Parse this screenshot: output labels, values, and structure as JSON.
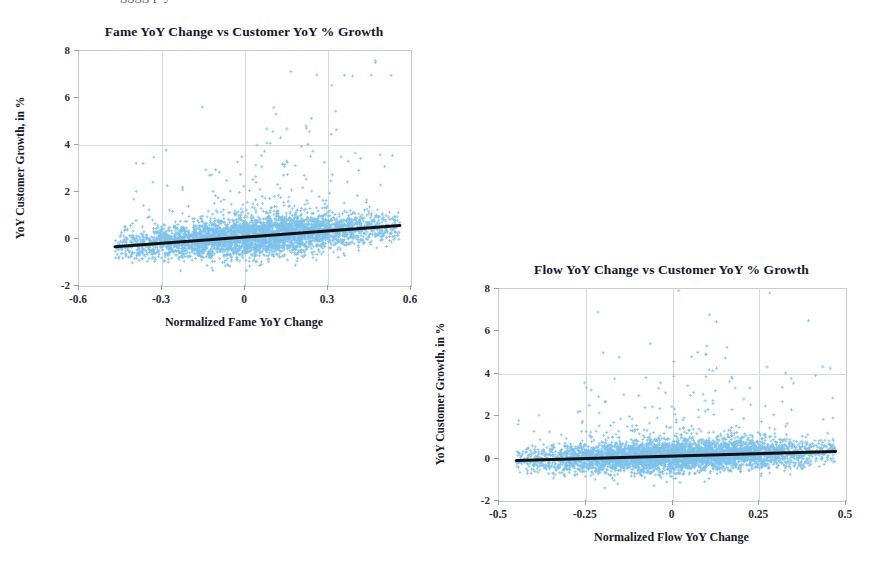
{
  "page": {
    "top_cut_text": "gggg  p  y"
  },
  "chart_data": [
    {
      "id": "fame",
      "type": "scatter",
      "title": "Fame YoY Change vs Customer YoY % Growth",
      "xlabel": "Normalized Fame YoY Change",
      "ylabel": "YoY Customer Growth, in %",
      "xlim": [
        -0.6,
        0.6
      ],
      "ylim": [
        -2,
        8
      ],
      "xticks": [
        "-0.6",
        "-0.3",
        "0",
        "0.3",
        "0.6"
      ],
      "xtick_values": [
        -0.6,
        -0.3,
        0,
        0.3,
        0.6
      ],
      "yticks": [
        "8",
        "6",
        "4",
        "2",
        "0",
        "-2"
      ],
      "ytick_values": [
        8,
        6,
        4,
        2,
        0,
        -2
      ],
      "grid": true,
      "grid_v_values": [
        -0.3,
        0,
        0.3
      ],
      "grid_h_values": [
        4
      ],
      "marker": "plus",
      "marker_color": "#7EC2EB",
      "point_count": 4000,
      "x_data_range": [
        -0.47,
        0.56
      ],
      "y_cloud_center_at_xmin": -0.32,
      "y_cloud_center_at_xmax": 0.55,
      "y_cloud_spread": 0.42,
      "outlier_fraction": 0.055,
      "trendline": {
        "color": "#111111",
        "width": 3,
        "x0": -0.47,
        "y0": -0.33,
        "x1": 0.56,
        "y1": 0.57
      }
    },
    {
      "id": "flow",
      "type": "scatter",
      "title": "Flow YoY Change vs Customer YoY % Growth",
      "xlabel": "Normalized Flow YoY Change",
      "ylabel": "YoY Customer Growth, in %",
      "xlim": [
        -0.5,
        0.5
      ],
      "ylim": [
        -2,
        8
      ],
      "xticks": [
        "-0.5",
        "-0.25",
        "0",
        "0.25",
        "0.5"
      ],
      "xtick_values": [
        -0.5,
        -0.25,
        0,
        0.25,
        0.5
      ],
      "yticks": [
        "8",
        "6",
        "4",
        "2",
        "0",
        "-2"
      ],
      "ytick_values": [
        8,
        6,
        4,
        2,
        0,
        -2
      ],
      "grid": true,
      "grid_v_values": [
        -0.25,
        0,
        0.25
      ],
      "grid_h_values": [
        4
      ],
      "marker": "plus",
      "marker_color": "#7EC2EB",
      "point_count": 4200,
      "x_data_range": [
        -0.45,
        0.47
      ],
      "y_cloud_center_at_xmin": -0.08,
      "y_cloud_center_at_xmax": 0.33,
      "y_cloud_spread": 0.38,
      "outlier_fraction": 0.05,
      "trendline": {
        "color": "#111111",
        "width": 3,
        "x0": -0.45,
        "y0": -0.09,
        "x1": 0.47,
        "y1": 0.34
      }
    }
  ],
  "layout": {
    "charts": [
      {
        "left": 0,
        "top": 8,
        "width": 430,
        "height": 330,
        "plot": {
          "left": 78,
          "top": 50,
          "width": 332,
          "height": 235
        }
      },
      {
        "left": 440,
        "top": 248,
        "width": 432,
        "height": 320,
        "plot": {
          "left": 498,
          "top": 288,
          "width": 347,
          "height": 212
        }
      }
    ]
  }
}
